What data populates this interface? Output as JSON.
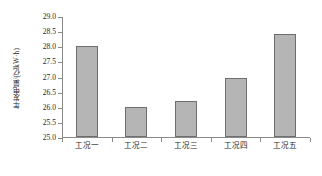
{
  "chart_data": {
    "type": "bar",
    "title": "",
    "xlabel": "",
    "ylabel": "年发电量/(亿kW·h)",
    "categories": [
      "工况一",
      "工况二",
      "工况三",
      "工况四",
      "工况五"
    ],
    "values": [
      28.0,
      26.0,
      26.2,
      26.95,
      28.4
    ],
    "ylim": [
      25.0,
      29.0
    ],
    "ytick_labels": [
      "25.0",
      "25.5",
      "26.0",
      "26.5",
      "27.0",
      "27.5",
      "28.0",
      "28.5",
      "29.0"
    ],
    "ytick_values": [
      25.0,
      25.5,
      26.0,
      26.5,
      27.0,
      27.5,
      28.0,
      28.5,
      29.0
    ],
    "grid": false,
    "legend": null,
    "colors": {
      "bar_fill": "#b5b5b5",
      "bar_border": "#6e6e6e",
      "axis": "#8a8a8a",
      "text": "#1f1f1f",
      "background": "#ffffff"
    }
  }
}
